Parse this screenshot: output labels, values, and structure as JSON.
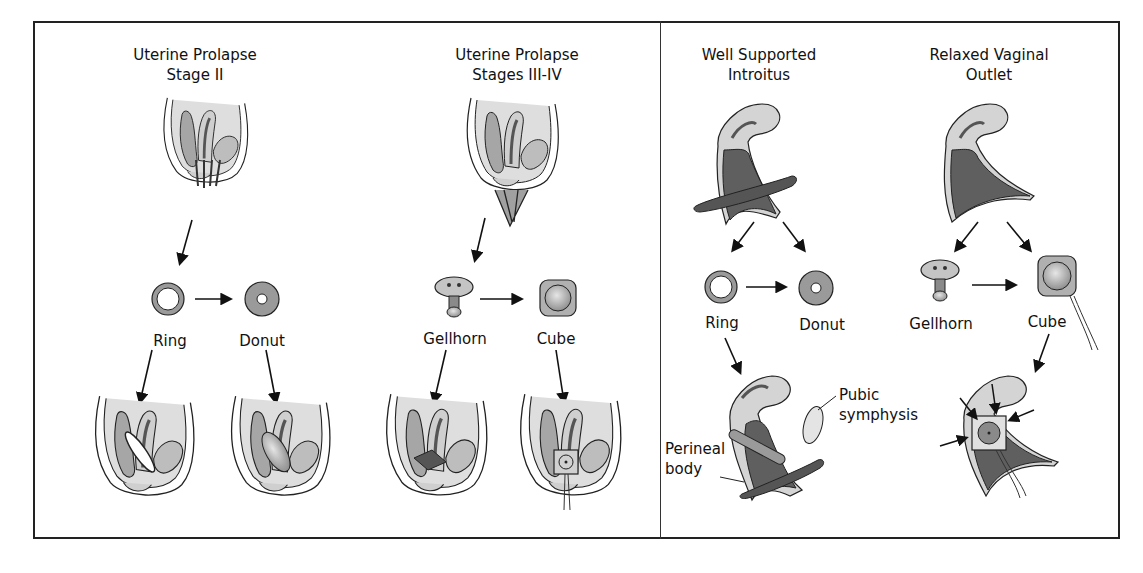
{
  "figure": {
    "panels": [
      {
        "id": "left",
        "columns": [
          {
            "title_line1": "Uterine Prolapse",
            "title_line2": "Stage II",
            "pessaries": [
              "Ring",
              "Donut"
            ]
          },
          {
            "title_line1": "Uterine Prolapse",
            "title_line2": "Stages III-IV",
            "pessaries": [
              "Gellhorn",
              "Cube"
            ]
          }
        ]
      },
      {
        "id": "right",
        "columns": [
          {
            "title_line1": "Well Supported",
            "title_line2": "Introitus",
            "pessaries": [
              "Ring",
              "Donut"
            ]
          },
          {
            "title_line1": "Relaxed Vaginal",
            "title_line2": "Outlet",
            "pessaries": [
              "Gellhorn",
              "Cube"
            ]
          }
        ],
        "annotations": {
          "pubic_line1": "Pubic",
          "pubic_line2": "symphysis",
          "perineal_line1": "Perineal",
          "perineal_line2": "body"
        }
      }
    ],
    "colors": {
      "frame": "#222222",
      "tissue_light": "#d9d9d9",
      "tissue_mid": "#a8a8a8",
      "tissue_dark": "#5a5a5a",
      "background": "#ffffff"
    }
  }
}
